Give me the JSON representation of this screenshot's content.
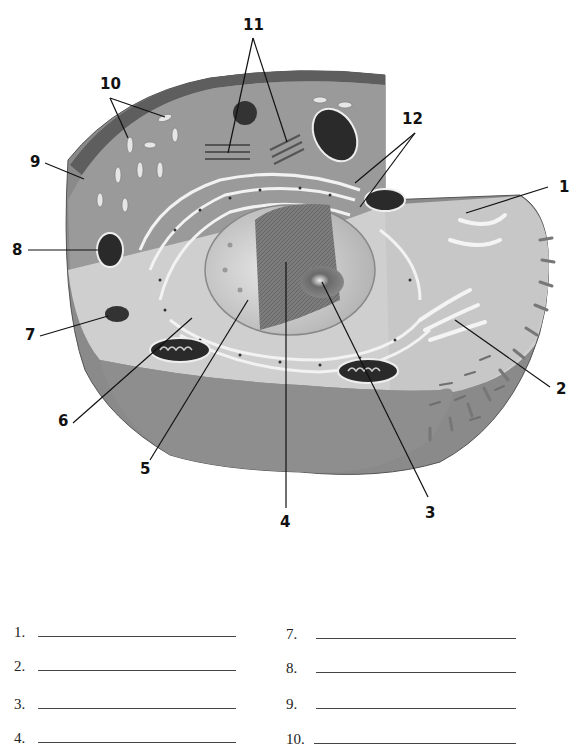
{
  "diagram": {
    "callouts": [
      {
        "id": "1",
        "label": "1",
        "x": 559,
        "y": 180
      },
      {
        "id": "2",
        "label": "2",
        "x": 556,
        "y": 382
      },
      {
        "id": "3",
        "label": "3",
        "x": 427,
        "y": 508
      },
      {
        "id": "4",
        "label": "4",
        "x": 282,
        "y": 518
      },
      {
        "id": "5",
        "label": "5",
        "x": 142,
        "y": 462
      },
      {
        "id": "6",
        "label": "6",
        "x": 59,
        "y": 416
      },
      {
        "id": "7",
        "label": "7",
        "x": 25,
        "y": 330
      },
      {
        "id": "8",
        "label": "8",
        "x": 13,
        "y": 244
      },
      {
        "id": "9",
        "label": "9",
        "x": 30,
        "y": 157
      },
      {
        "id": "10",
        "label": "10",
        "x": 100,
        "y": 78
      },
      {
        "id": "11",
        "label": "11",
        "x": 245,
        "y": 20
      },
      {
        "id": "12",
        "label": "12",
        "x": 404,
        "y": 113
      }
    ]
  },
  "answer_key": {
    "left": [
      {
        "num": "1."
      },
      {
        "num": "2."
      },
      {
        "num": "3."
      },
      {
        "num": "4."
      }
    ],
    "right": [
      {
        "num": "7."
      },
      {
        "num": "8."
      },
      {
        "num": "9."
      },
      {
        "num": "10."
      }
    ]
  }
}
